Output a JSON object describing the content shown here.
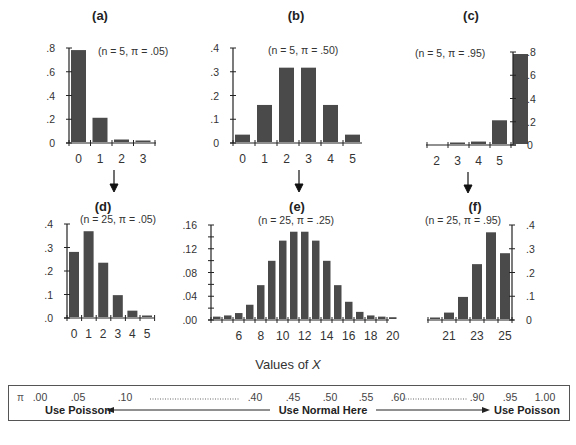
{
  "x_axis_label": "Values of X",
  "arrows": [
    "a-to-d",
    "b-to-e",
    "c-to-f"
  ],
  "chart_data": [
    {
      "panel": "(a)",
      "type": "bar",
      "params": "(n = 5, π = .05)",
      "categories": [
        0,
        1,
        2,
        3
      ],
      "values": [
        0.774,
        0.204,
        0.021,
        0.001
      ],
      "yticks": [
        ".8",
        ".6",
        ".4",
        ".2",
        "0"
      ],
      "ylim": [
        0,
        0.8
      ],
      "yaxis_side": "left",
      "xticks": [
        "0",
        "1",
        "2",
        "3"
      ]
    },
    {
      "panel": "(b)",
      "type": "bar",
      "params": "(n = 5, π = .50)",
      "categories": [
        0,
        1,
        2,
        3,
        4,
        5
      ],
      "values": [
        0.031,
        0.156,
        0.313,
        0.313,
        0.156,
        0.031
      ],
      "yticks": [
        ".4",
        ".3",
        ".2",
        ".1",
        "0"
      ],
      "ylim": [
        0,
        0.4
      ],
      "yaxis_side": "left",
      "xticks": [
        "0",
        "1",
        "2",
        "3",
        "4",
        "5"
      ]
    },
    {
      "panel": "(c)",
      "type": "bar",
      "params": "(n = 5, π = .95)",
      "categories": [
        2,
        3,
        4,
        5
      ],
      "values": [
        0.001,
        0.021,
        0.204,
        0.774
      ],
      "yticks": [
        ".8",
        ".6",
        ".4",
        ".2",
        "0"
      ],
      "ylim": [
        0,
        0.8
      ],
      "yaxis_side": "right",
      "xticks": [
        "2",
        "3",
        "4",
        "5"
      ]
    },
    {
      "panel": "(d)",
      "type": "bar",
      "params": "(n = 25, π = .05)",
      "categories": [
        0,
        1,
        2,
        3,
        4,
        5
      ],
      "values": [
        0.277,
        0.365,
        0.231,
        0.093,
        0.027,
        0.006
      ],
      "yticks": [
        ".4",
        ".3",
        ".2",
        ".1",
        ".0"
      ],
      "ylim": [
        0,
        0.4
      ],
      "yaxis_side": "left",
      "xticks": [
        "0",
        "1",
        "2",
        "3",
        "4",
        "5"
      ]
    },
    {
      "panel": "(e)",
      "type": "bar",
      "params": "(n = 25, π = .25)",
      "categories": [
        4,
        5,
        6,
        7,
        8,
        9,
        10,
        11,
        12,
        13,
        14,
        15,
        16,
        17,
        18,
        19,
        20
      ],
      "values": [
        0.004,
        0.006,
        0.01,
        0.024,
        0.057,
        0.098,
        0.132,
        0.147,
        0.147,
        0.132,
        0.098,
        0.057,
        0.029,
        0.012,
        0.006,
        0.004,
        0.003
      ],
      "yticks": [
        ".16",
        ".12",
        ".08",
        ".04",
        ".00"
      ],
      "ylim": [
        0,
        0.16
      ],
      "yaxis_side": "left",
      "xticks": [
        "6",
        "8",
        "10",
        "12",
        "14",
        "16",
        "18",
        "20"
      ]
    },
    {
      "panel": "(f)",
      "type": "bar",
      "params": "(n = 25, π = .95)",
      "categories": [
        20,
        21,
        22,
        23,
        24,
        25
      ],
      "values": [
        0.006,
        0.027,
        0.093,
        0.231,
        0.365,
        0.277
      ],
      "yticks": [
        ".4",
        ".3",
        ".2",
        ".1",
        "0"
      ],
      "ylim": [
        0,
        0.4
      ],
      "yaxis_side": "right",
      "xticks": [
        "21",
        "23",
        "25"
      ]
    }
  ],
  "pi_scale": {
    "symbol": "π",
    "values": [
      ".00",
      ".05",
      ".10",
      ".40",
      ".45",
      ".50",
      ".55",
      ".60",
      ".90",
      ".95",
      "1.00"
    ],
    "left_label": "Use Poisson",
    "center_label": "Use Normal Here",
    "right_label": "Use Poisson"
  }
}
